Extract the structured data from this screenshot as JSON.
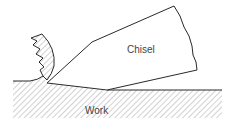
{
  "diagram": {
    "title": "",
    "labels": {
      "chisel": "Chisel",
      "work": "Work"
    },
    "elements": [
      {
        "id": "chisel",
        "type": "polygon",
        "description": "Wedge-shaped cutting tool"
      },
      {
        "id": "work",
        "type": "hatched-region",
        "description": "Workpiece material"
      },
      {
        "id": "chip",
        "type": "curled-hatched-shape",
        "description": "Chip curling off workpiece ahead of chisel"
      }
    ]
  },
  "colors": {
    "line": "#2a2a2a",
    "hatch": "#9a9a9a",
    "text": "#444444",
    "background": "#ffffff"
  }
}
